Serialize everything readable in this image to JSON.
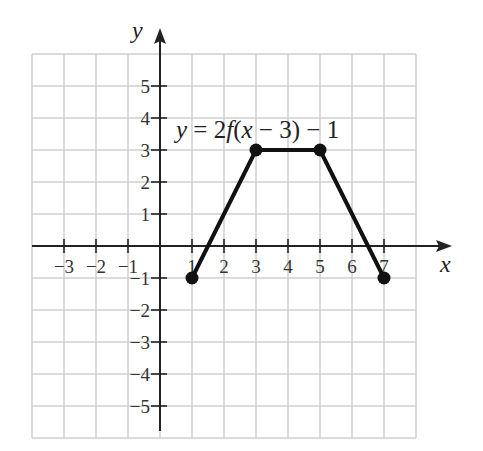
{
  "chart_data": {
    "type": "line",
    "title": "",
    "annotation": "y = 2f(x − 3) − 1",
    "xlabel": "x",
    "ylabel": "y",
    "xlim": [
      -4,
      8
    ],
    "ylim": [
      -6,
      6
    ],
    "grid": true,
    "x_ticks": [
      -3,
      -2,
      -1,
      1,
      2,
      3,
      4,
      5,
      6,
      7
    ],
    "y_ticks": [
      -5,
      -4,
      -3,
      -2,
      -1,
      1,
      2,
      3,
      4,
      5
    ],
    "x_tick_labels": [
      "−3",
      "−2",
      "−1",
      "1",
      "2",
      "3",
      "4",
      "5",
      "6",
      "7"
    ],
    "y_tick_labels": [
      "−5",
      "−4",
      "−3",
      "−2",
      "−1",
      "1",
      "2",
      "3",
      "4",
      "5"
    ],
    "series": [
      {
        "name": "y = 2f(x − 3) − 1",
        "x": [
          1,
          3,
          5,
          7
        ],
        "y": [
          -1,
          3,
          3,
          -1
        ],
        "markers": "filled-circle",
        "color": "#111111"
      }
    ]
  },
  "labels": {
    "x_axis": "x",
    "y_axis": "y",
    "eq_y": "y",
    "eq_rest": " = 2",
    "eq_f": "f",
    "eq_paren": "(",
    "eq_x": "x",
    "eq_tail": " − 3) − 1"
  }
}
